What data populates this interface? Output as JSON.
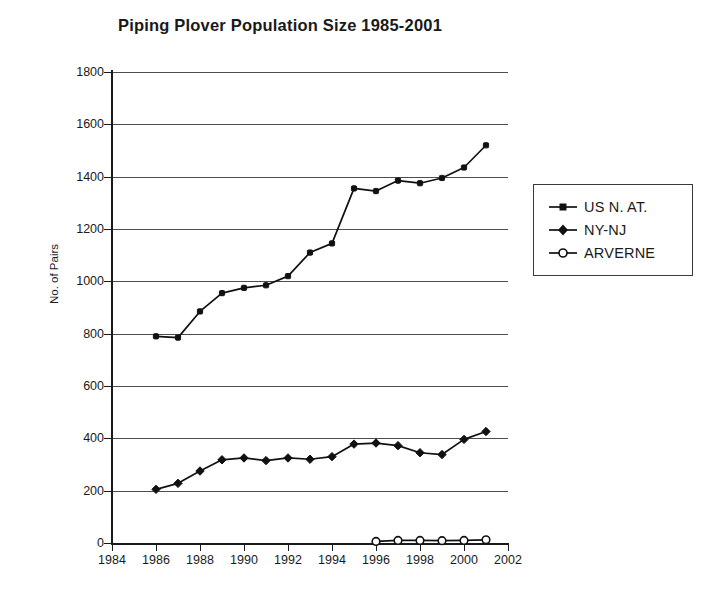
{
  "chart_data": {
    "type": "line",
    "title": "Piping Plover Population Size 1985-2001",
    "xlabel": "",
    "ylabel": "No. of Pairs",
    "xlim": [
      1984,
      2002
    ],
    "ylim": [
      0,
      1800
    ],
    "xticks": [
      1984,
      1986,
      1988,
      1990,
      1992,
      1994,
      1996,
      1998,
      2000,
      2002
    ],
    "yticks": [
      0,
      200,
      400,
      600,
      800,
      1000,
      1200,
      1400,
      1600,
      1800
    ],
    "grid": "horizontal",
    "legend_position": "right",
    "series": [
      {
        "name": "US N. AT.",
        "marker": "filled-square",
        "x": [
          1986,
          1987,
          1988,
          1989,
          1990,
          1991,
          1992,
          1993,
          1994,
          1995,
          1996,
          1997,
          1998,
          1999,
          2000,
          2001
        ],
        "values": [
          790,
          785,
          885,
          955,
          975,
          985,
          1020,
          1110,
          1145,
          1355,
          1345,
          1385,
          1375,
          1395,
          1435,
          1520
        ]
      },
      {
        "name": "NY-NJ",
        "marker": "filled-diamond",
        "x": [
          1986,
          1987,
          1988,
          1989,
          1990,
          1991,
          1992,
          1993,
          1994,
          1995,
          1996,
          1997,
          1998,
          1999,
          2000,
          2001
        ],
        "values": [
          205,
          228,
          275,
          318,
          325,
          315,
          325,
          320,
          330,
          378,
          382,
          372,
          345,
          338,
          396,
          426
        ]
      },
      {
        "name": "ARVERNE",
        "marker": "open-circle",
        "x": [
          1996,
          1997,
          1998,
          1999,
          2000,
          2001
        ],
        "values": [
          6,
          10,
          10,
          9,
          10,
          12
        ]
      }
    ]
  },
  "legend": {
    "items": [
      {
        "label": "US N. AT."
      },
      {
        "label": "NY-NJ"
      },
      {
        "label": "ARVERNE"
      }
    ]
  },
  "colors": {
    "series_line": "#111111",
    "gridline": "#4d4d4d",
    "axis": "#1a1a1a",
    "background": "#ffffff"
  }
}
